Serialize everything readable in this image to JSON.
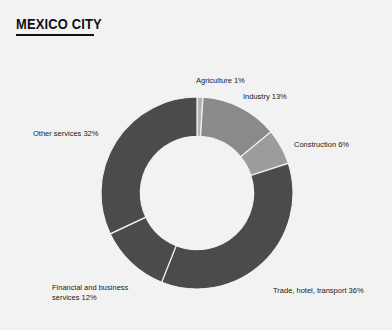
{
  "header": {
    "title": "MEXICO CITY"
  },
  "chart_data": {
    "type": "pie",
    "variant": "donut",
    "title": "MEXICO CITY",
    "xlabel": "",
    "ylabel": "",
    "units": "percent",
    "total": 100,
    "start_angle_deg": 0,
    "direction": "clockwise",
    "inner_radius_ratio": 0.59,
    "legend_position": "none",
    "labels_style": "outside-adjacent",
    "grid": false,
    "background_color": "#f2f2f2",
    "separator_color": "#f2f2f2",
    "categories": [
      "Agriculture",
      "Industry",
      "Construction",
      "Trade, hotel, transport",
      "Financial and business services",
      "Other services"
    ],
    "values": [
      1,
      13,
      6,
      36,
      12,
      32
    ],
    "colors": [
      "#b4b4b4",
      "#8a8a8a",
      "#9c9c9c",
      "#4b4b4b",
      "#4b4b4b",
      "#4b4b4b"
    ],
    "slices": [
      {
        "name": "Agriculture",
        "value": 1,
        "color": "#b4b4b4",
        "label": "Agriculture 1%"
      },
      {
        "name": "Industry",
        "value": 13,
        "color": "#8a8a8a",
        "label": "Industry 13%"
      },
      {
        "name": "Construction",
        "value": 6,
        "color": "#9c9c9c",
        "label": "Construction 6%"
      },
      {
        "name": "Trade, hotel, transport",
        "value": 36,
        "color": "#4b4b4b",
        "label": "Trade, hotel, transport 36%"
      },
      {
        "name": "Financial and business services",
        "value": 12,
        "color": "#4b4b4b",
        "label": "Financial and business services 12%"
      },
      {
        "name": "Other services",
        "value": 32,
        "color": "#4b4b4b",
        "label": "Other services 32%"
      }
    ]
  },
  "labels": {
    "agriculture": "Agriculture 1%",
    "industry": "Industry 13%",
    "construction": "Construction 6%",
    "trade": "Trade, hotel, transport 36%",
    "financial": "Financial and business services 12%",
    "other": "Other services 32%"
  }
}
